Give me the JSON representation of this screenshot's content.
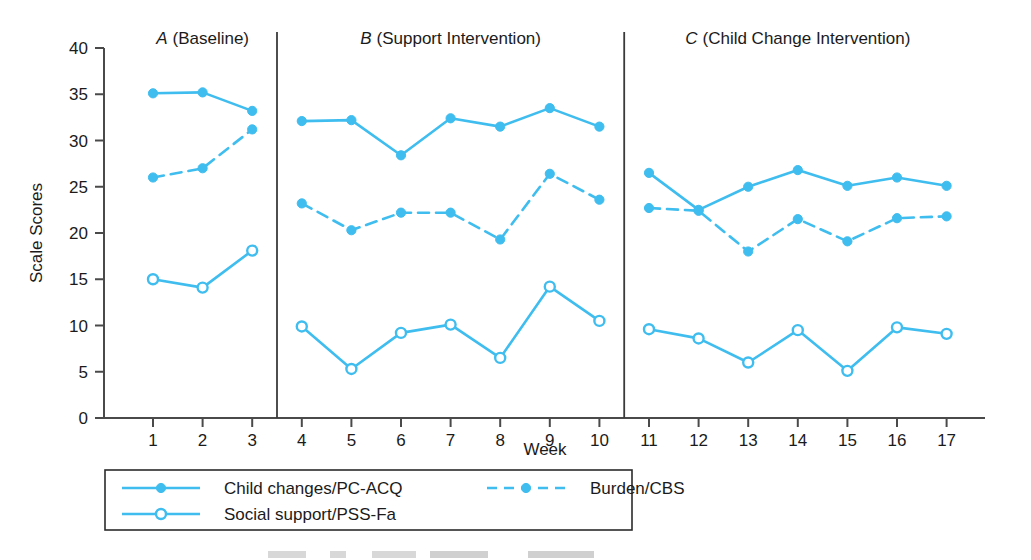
{
  "chart_data": {
    "type": "line",
    "title": "",
    "xlabel": "Week",
    "ylabel": "Scale Scores",
    "xlim": [
      0,
      18
    ],
    "ylim": [
      0,
      40
    ],
    "ytick_values": [
      0,
      5,
      10,
      15,
      20,
      25,
      30,
      35,
      40
    ],
    "xtick_values": [
      1,
      2,
      3,
      4,
      5,
      6,
      7,
      8,
      9,
      10,
      11,
      12,
      13,
      14,
      15,
      16,
      17
    ],
    "grid": false,
    "legend_position": "below-axes",
    "x": [
      1,
      2,
      3,
      4,
      5,
      6,
      7,
      8,
      9,
      10,
      11,
      12,
      13,
      14,
      15,
      16,
      17
    ],
    "series": [
      {
        "name": "Child changes/PC-ACQ",
        "color": "#3fbdef",
        "line_style": "solid",
        "marker": "filled-circle",
        "values": [
          35.1,
          35.2,
          33.2,
          32.1,
          32.2,
          28.4,
          32.4,
          31.5,
          33.5,
          31.5,
          26.5,
          22.5,
          25.0,
          26.8,
          25.1,
          26.0,
          25.1
        ]
      },
      {
        "name": "Burden/CBS",
        "color": "#3fbdef",
        "line_style": "dashed",
        "marker": "filled-circle",
        "values": [
          26.0,
          27.0,
          31.2,
          23.2,
          20.3,
          22.2,
          22.2,
          19.3,
          26.4,
          23.6,
          22.7,
          22.4,
          18.0,
          21.5,
          19.1,
          21.6,
          21.8
        ]
      },
      {
        "name": "Social support/PSS-Fa",
        "color": "#3fbdef",
        "line_style": "solid",
        "marker": "open-circle",
        "values": [
          15.0,
          14.1,
          18.1,
          9.9,
          5.3,
          9.2,
          10.1,
          6.5,
          14.2,
          10.5,
          9.6,
          8.6,
          6.0,
          9.5,
          5.1,
          9.8,
          9.1
        ]
      }
    ],
    "phases": [
      {
        "letter": "A",
        "label": "(Baseline)",
        "weeks": [
          1,
          3
        ]
      },
      {
        "letter": "B",
        "label": "(Support Intervention)",
        "weeks": [
          4,
          10
        ]
      },
      {
        "letter": "C",
        "label": "(Child Change Intervention)",
        "weeks": [
          11,
          17
        ]
      }
    ],
    "phase_dividers": [
      3.5,
      10.5
    ]
  },
  "axes": {
    "ylabel": "Scale Scores",
    "xlabel": "Week",
    "yticks": [
      "0",
      "5",
      "10",
      "15",
      "20",
      "25",
      "30",
      "35",
      "40"
    ],
    "xticks": [
      "1",
      "2",
      "3",
      "4",
      "5",
      "6",
      "7",
      "8",
      "9",
      "10",
      "11",
      "12",
      "13",
      "14",
      "15",
      "16",
      "17"
    ]
  },
  "phase_headers": [
    {
      "letter": "A",
      "text": "(Baseline)"
    },
    {
      "letter": "B",
      "text": "(Support Intervention)"
    },
    {
      "letter": "C",
      "text": "(Child Change Intervention)"
    }
  ],
  "legend": {
    "entries": [
      {
        "label": "Child changes/PC-ACQ",
        "style": "solid",
        "marker": "filled-circle"
      },
      {
        "label": "Burden/CBS",
        "style": "dashed",
        "marker": "filled-circle"
      },
      {
        "label": "Social support/PSS-Fa",
        "style": "solid",
        "marker": "open-circle"
      }
    ]
  },
  "colors": {
    "series_blue": "#3fbdef",
    "axis_black": "#1b1b1b",
    "background": "#ffffff"
  }
}
